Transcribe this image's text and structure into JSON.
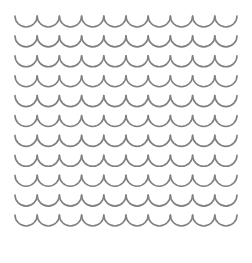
{
  "canvas": {
    "width": 252,
    "height": 263,
    "background_color": "#ffffff",
    "title": "Scallop Wave Pattern"
  },
  "pattern": {
    "name": "scalloped-wave-pattern",
    "motif": "u-arc",
    "description": "Repeating grid of upward-opening semicircular arcs forming scalloped wave rows",
    "stroke_color": "#808080",
    "stroke_width": 1.6,
    "fill": "none",
    "line_cap": "round",
    "rows": 11,
    "columns": 10,
    "origin_x": 15,
    "origin_y": 16,
    "arc_width": 22.2,
    "arc_depth": 11,
    "row_pitch": 19.9
  },
  "watermark": {
    "text": " ",
    "color": "#fdfdfd"
  }
}
